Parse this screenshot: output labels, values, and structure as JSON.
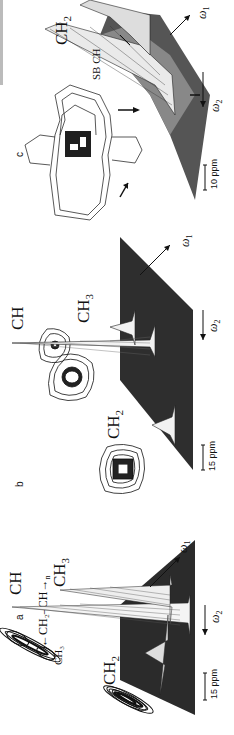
{
  "figure": {
    "orientation": "rotated 90 degrees counter-clockwise",
    "panels": [
      {
        "letter": "a",
        "structure_formula": {
          "main": "←CH₂–CH→",
          "subscript_n": "n",
          "side_group": "CH₃"
        },
        "peak_labels": [
          "CH",
          "CH₃",
          "CH₂"
        ],
        "axes": {
          "omega1": "ω",
          "omega1_sub": "1",
          "omega2": "ω",
          "omega2_sub": "2"
        },
        "scale_bar": "15 ppm"
      },
      {
        "letter": "b",
        "peak_labels": [
          "CH",
          "CH₃",
          "CH₂"
        ],
        "axes": {
          "omega1": "ω",
          "omega1_sub": "1",
          "omega2": "ω",
          "omega2_sub": "2"
        },
        "scale_bar": "15 ppm"
      },
      {
        "letter": "c",
        "peak_labels": [
          "CH₂",
          "SB CH"
        ],
        "axes": {
          "omega1": "ω",
          "omega1_sub": "1",
          "omega2": "ω",
          "omega2_sub": "2"
        },
        "scale_bar": "10 ppm"
      }
    ]
  },
  "colors": {
    "ink": "#111111",
    "surface_dark": "#2a2a2a",
    "surface_mid": "#6a6a6a",
    "paper": "#ffffff"
  }
}
